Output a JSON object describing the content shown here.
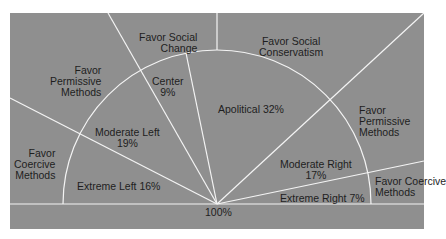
{
  "colors": {
    "panel": "#8f8f8f",
    "lines": "#f4f4f4",
    "text": "#1e1e1e"
  },
  "center_label": "100%",
  "segments": [
    {
      "name": "Extreme Left",
      "percent": "16%",
      "label": "Extreme Left 16%"
    },
    {
      "name": "Moderate Left",
      "percent": "19%",
      "label": "Moderate Left\n19%"
    },
    {
      "name": "Center",
      "percent": "9%",
      "label": "Center\n9%"
    },
    {
      "name": "Apolitical",
      "percent": "32%",
      "label": "Apolitical 32%"
    },
    {
      "name": "Moderate Right",
      "percent": "17%",
      "label": "Moderate Right\n17%"
    },
    {
      "name": "Extreme Right",
      "percent": "7%",
      "label": "Extreme Right 7%"
    }
  ],
  "outer_regions": {
    "left_coercive": "Favor\nCoercive\nMethods",
    "left_permissive": "Favor\nPermissive\nMethods",
    "social_change": "Favor Social\nChange",
    "social_conservatism": "Favor Social\nConservatism",
    "right_permissive": "Favor\nPermissive\nMethods",
    "right_coercive": "Favor Coercive\nMethods"
  }
}
